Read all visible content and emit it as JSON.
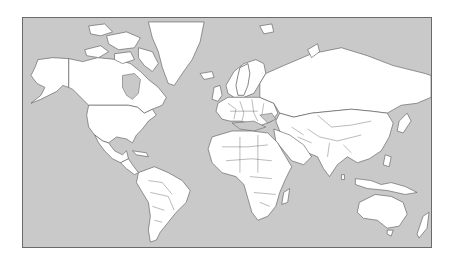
{
  "map": {
    "projection": "Mercator",
    "highlighted_country": "Sweden",
    "colors": {
      "ocean": "#c9c9c9",
      "land": "#ffffff",
      "border": "#555555",
      "highlight": "#4a4a4a",
      "frame": "#6a6a6a"
    }
  }
}
